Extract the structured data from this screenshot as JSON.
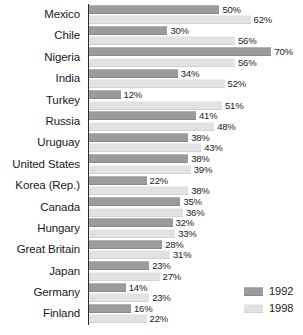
{
  "chart_data": {
    "type": "bar",
    "title": "",
    "subtitle": "",
    "xlabel": "",
    "ylabel": "",
    "orientation": "horizontal",
    "grid": false,
    "legend_position": "bottom-right",
    "xlim": [
      0,
      70
    ],
    "value_suffix": "%",
    "categories": [
      "Mexico",
      "Chile",
      "Nigeria",
      "India",
      "Turkey",
      "Russia",
      "Uruguay",
      "United States",
      "Korea (Rep.)",
      "Canada",
      "Hungary",
      "Great Britain",
      "Japan",
      "Germany",
      "Finland"
    ],
    "series": [
      {
        "name": "1992",
        "color": "#9b9b9b",
        "values": [
          50,
          30,
          70,
          34,
          12,
          41,
          38,
          38,
          22,
          35,
          32,
          28,
          23,
          14,
          16
        ],
        "labels": [
          "50%",
          "30%",
          "70%",
          "34%",
          "12%",
          "41%",
          "38%",
          "38%",
          "22%",
          "35%",
          "32%",
          "28%",
          "23%",
          "14%",
          "16%"
        ]
      },
      {
        "name": "1998",
        "color": "#e2e2e2",
        "values": [
          62,
          56,
          56,
          52,
          51,
          48,
          43,
          39,
          38,
          36,
          33,
          31,
          27,
          23,
          22
        ],
        "labels": [
          "62%",
          "56%",
          "56%",
          "52%",
          "51%",
          "48%",
          "43%",
          "39%",
          "38%",
          "36%",
          "33%",
          "31%",
          "27%",
          "23%",
          "22%"
        ]
      }
    ]
  },
  "legend": {
    "items": [
      {
        "label": "1992",
        "color": "#9b9b9b"
      },
      {
        "label": "1998",
        "color": "#e2e2e2"
      }
    ]
  }
}
